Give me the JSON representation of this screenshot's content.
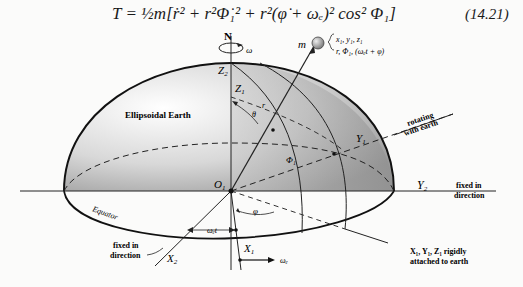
{
  "equation": {
    "text": "T  =  ½m[ṙ² + r²Φ̇₁² + r²(φ̇ + ωₑ)² cos² Φ₁]",
    "number": "(14.21)"
  },
  "diagram": {
    "title_label": "Ellipsoidal Earth",
    "axes": {
      "north": "N",
      "omega": "ω",
      "z2": "Z",
      "z2_sub": "2",
      "z1": "Z",
      "z1_sub": "1",
      "y1": "Y",
      "y1_sub": "1",
      "y2": "Y",
      "y2_sub": "2",
      "x1": "X",
      "x1_sub": "1",
      "x2": "X",
      "x2_sub": "2",
      "origin": "O",
      "origin_sub": "1"
    },
    "mass": {
      "label": "m",
      "coords_line1": "x₁, y₁, z₁",
      "coords_line2": "r, Φ₁, (ωₑt + φ)"
    },
    "angles": {
      "theta": "θ",
      "Phi1": "Φ₁",
      "phi": "φ",
      "omega_e_t": "ωₑt",
      "r": "r",
      "omega_e": "ωₑ"
    },
    "annotations": {
      "rotating_line1": "rotating",
      "rotating_line2": "with earth",
      "fixed_y_line1": "fixed in",
      "fixed_y_line2": "direction",
      "fixed_x_line1": "fixed in",
      "fixed_x_line2": "direction",
      "equator": "Equator",
      "attached_line1": "X₁, Y₁, Z₁ rigidly",
      "attached_line2": "attached to earth"
    }
  }
}
